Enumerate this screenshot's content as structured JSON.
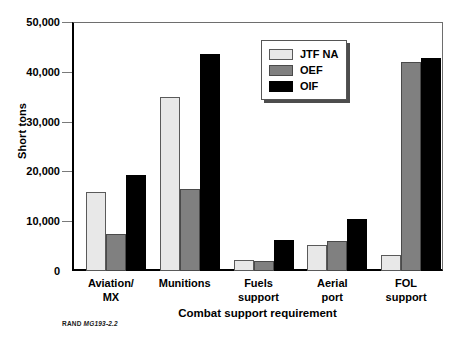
{
  "chart_data": {
    "type": "bar",
    "title": "",
    "xlabel": "Combat support requirement",
    "ylabel": "Short tons",
    "categories": [
      "Aviation/ MX",
      "Munitions",
      "Fuels support",
      "Aerial port",
      "FOL support"
    ],
    "category_lines": [
      [
        "Aviation/",
        "MX"
      ],
      [
        "Munitions",
        ""
      ],
      [
        "Fuels",
        "support"
      ],
      [
        "Aerial",
        "port"
      ],
      [
        "FOL",
        "support"
      ]
    ],
    "series": [
      {
        "name": "JTF NA",
        "color": "#e8e8e8",
        "values": [
          15800,
          35000,
          2200,
          5300,
          3300
        ]
      },
      {
        "name": "OEF",
        "color": "#808080",
        "values": [
          7400,
          16400,
          2000,
          6100,
          42000
        ]
      },
      {
        "name": "OIF",
        "color": "#000000",
        "values": [
          19300,
          43600,
          6300,
          10400,
          42700
        ]
      }
    ],
    "ylim": [
      0,
      50000
    ],
    "yticks": [
      0,
      10000,
      20000,
      30000,
      40000,
      50000
    ],
    "ytick_labels": [
      "0",
      "10,000",
      "20,000",
      "30,000",
      "40,000",
      "50,000"
    ],
    "grid": false,
    "legend_position": "top-right"
  },
  "legend": {
    "items": [
      {
        "label": "JTF NA",
        "swatch": "legend-swatch-jtf-na"
      },
      {
        "label": "OEF",
        "swatch": "legend-swatch-oef"
      },
      {
        "label": "OIF",
        "swatch": "legend-swatch-oif"
      }
    ]
  },
  "source_note": {
    "prefix": "RAND ",
    "id": "MG193-2.2"
  }
}
